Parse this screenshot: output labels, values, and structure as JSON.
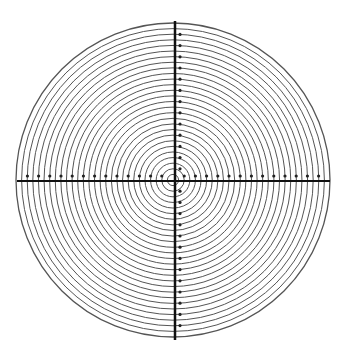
{
  "diagram": {
    "title": "Concentric circle reticle with crosshair",
    "type": "concentric-ring-reticle",
    "center": {
      "x": 173,
      "y": 180
    },
    "outer_radius": 157,
    "ring_count": 28,
    "ring_spacing": 5.6,
    "colors": {
      "background": "#ffffff",
      "ring": "#555555",
      "axis": "#111111",
      "dot": "#222222"
    },
    "axes": {
      "horizontal": {
        "y": 181,
        "x_start": 17,
        "x_end": 330,
        "stroke_width": 2
      },
      "vertical": {
        "x": 175,
        "y_start": 21,
        "y_end": 340,
        "stroke_width": 2.5
      }
    },
    "tick_dots": {
      "spacing": 11.2,
      "radius": 1.6,
      "horizontal_offset_y": -5,
      "vertical_offset_x": 5
    }
  }
}
